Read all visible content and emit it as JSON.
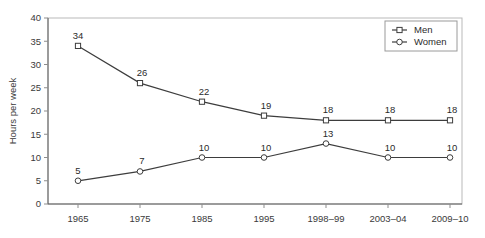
{
  "chart_data": {
    "type": "line",
    "title": "",
    "xlabel": "",
    "ylabel": "Hours per week",
    "categories": [
      "1965",
      "1975",
      "1985",
      "1995",
      "1998–99",
      "2003–04",
      "2009–10"
    ],
    "ylim": [
      0,
      40
    ],
    "yticks": [
      0,
      5,
      10,
      15,
      20,
      25,
      30,
      35,
      40
    ],
    "ytick_labels": [
      "0",
      "5",
      "10",
      "15",
      "20",
      "25",
      "30",
      "35",
      "40"
    ],
    "grid": false,
    "legend_position": "top-right",
    "series": [
      {
        "name": "Men",
        "marker": "square",
        "color": "#3d3d3d",
        "values": [
          34,
          26,
          22,
          19,
          18,
          18,
          18
        ],
        "labels": [
          "34",
          "26",
          "22",
          "19",
          "18",
          "18",
          "18"
        ]
      },
      {
        "name": "Women",
        "marker": "circle",
        "color": "#3d3d3d",
        "values": [
          5,
          7,
          10,
          10,
          13,
          10,
          10
        ],
        "labels": [
          "5",
          "7",
          "10",
          "10",
          "13",
          "10",
          "10"
        ]
      }
    ]
  },
  "legend": {
    "entries": [
      {
        "label": "Men"
      },
      {
        "label": "Women"
      }
    ]
  },
  "axes": {
    "y_title": "Hours per week"
  }
}
